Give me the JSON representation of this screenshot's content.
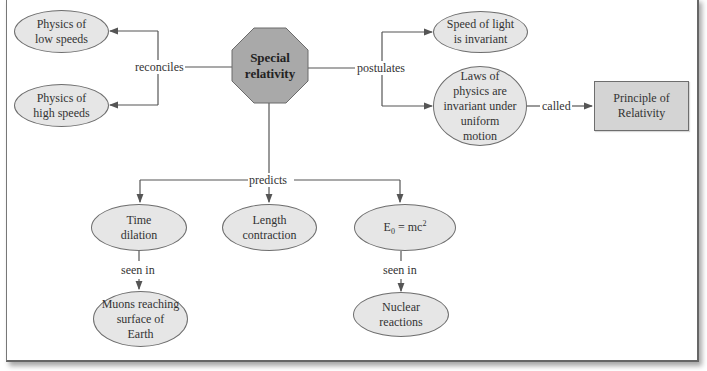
{
  "diagram": {
    "central": {
      "label_line1": "Special",
      "label_line2": "relativity",
      "shape": "octagon"
    },
    "nodes": {
      "low_speeds": {
        "line1": "Physics of",
        "line2": "low speeds"
      },
      "high_speeds": {
        "line1": "Physics of",
        "line2": "high speeds"
      },
      "speed_of_light": {
        "line1": "Speed of light",
        "line2": "is invariant"
      },
      "laws_invariant": {
        "line1": "Laws of",
        "line2": "physics are",
        "line3": "invariant under",
        "line4": "uniform",
        "line5": "motion"
      },
      "principle": {
        "line1": "Principle of",
        "line2": "Relativity"
      },
      "time_dilation": {
        "line1": "Time",
        "line2": "dilation"
      },
      "length_contraction": {
        "line1": "Length",
        "line2": "contraction"
      },
      "energy": {
        "base": "E",
        "sub": "0",
        "mid": " = mc",
        "sup": "2"
      },
      "muons": {
        "line1": "Muons reaching",
        "line2": "surface of",
        "line3": "Earth"
      },
      "nuclear": {
        "line1": "Nuclear",
        "line2": "reactions"
      }
    },
    "links": {
      "reconciles": "reconciles",
      "postulates": "postulates",
      "called": "called",
      "predicts": "predicts",
      "seen_in_1": "seen in",
      "seen_in_2": "seen in"
    },
    "colors": {
      "octagon_fill": "#a9a9a9",
      "ellipse_fill": "#e6e6e6",
      "rect_fill": "#d4d4d4",
      "line": "#555555"
    }
  }
}
